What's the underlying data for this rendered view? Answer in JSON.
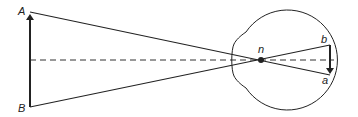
{
  "diagram": {
    "title": "",
    "labels": {
      "object_top": "A",
      "object_bottom": "B",
      "nodal_point": "n",
      "image_top": "b",
      "image_bottom": "a"
    },
    "elements": [
      {
        "id": "object-arrow",
        "description": "Upright object arrow from B to A"
      },
      {
        "id": "ray-A",
        "description": "Ray from A through nodal point n to a"
      },
      {
        "id": "ray-B",
        "description": "Ray from B through nodal point n to b"
      },
      {
        "id": "optical-axis",
        "description": "Dashed optical axis"
      },
      {
        "id": "eyeball",
        "description": "Eyeball outline with cornea bulge"
      },
      {
        "id": "image-arrow",
        "description": "Inverted image arrow on retina from b to a"
      }
    ],
    "colors": {
      "stroke": "#222222",
      "background": "#ffffff"
    }
  }
}
